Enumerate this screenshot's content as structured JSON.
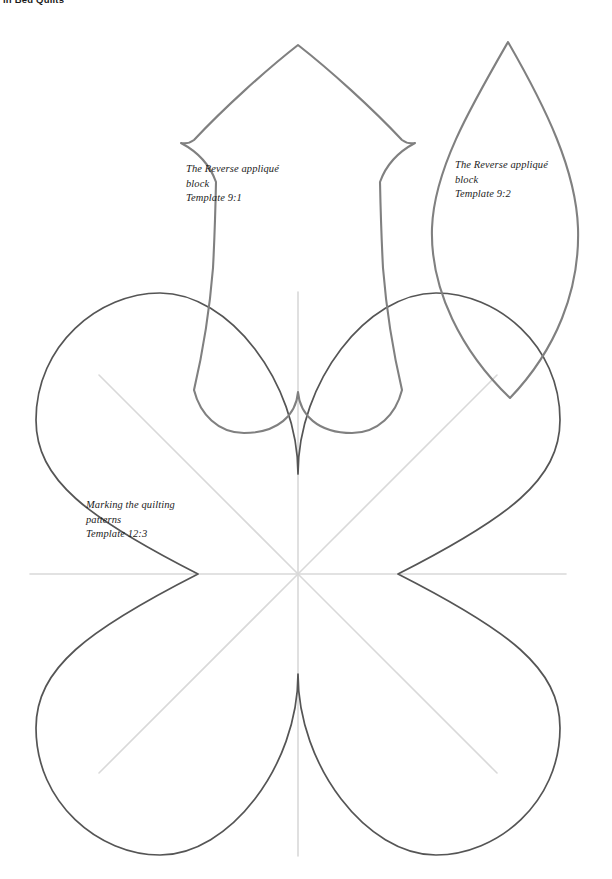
{
  "page": {
    "running_head": "in Bed Quilts",
    "background_color": "#ffffff",
    "width": 612,
    "height": 879
  },
  "colors": {
    "tulip_outline": "#808080",
    "leaf_outline": "#808080",
    "flower_outline": "#555555",
    "fold_line": "#d9d9d9",
    "label_text": "#1c1c1c",
    "running_head_text": "#1a1a1a"
  },
  "templates": [
    {
      "id": "tulip",
      "name": "reverse-applique-block-tulip",
      "shape": "tulip",
      "outline_color": "#808080",
      "label": {
        "line1": "The Reverse appliqué",
        "line2": "block",
        "line3": "Template 9:1",
        "text": "The Reverse appliqué\nblock\nTemplate 9:1"
      }
    },
    {
      "id": "leaf",
      "name": "reverse-applique-block-leaf",
      "shape": "pointed-oval-leaf",
      "outline_color": "#808080",
      "label": {
        "line1": "The Reverse appliqué",
        "line2": "block",
        "line3": "Template 9:2",
        "text": "The Reverse appliqué\nblock\nTemplate 9:2"
      }
    },
    {
      "id": "flower",
      "name": "marking-the-quilting-patterns-flower",
      "shape": "eight-petal-flower",
      "petal_count": 8,
      "fold_line_count": 8,
      "outline_color": "#555555",
      "label": {
        "line1": "Marking the quilting",
        "line2": "patterns",
        "line3": "Template 12:3",
        "text": "Marking the quilting\npatterns\nTemplate 12:3"
      }
    }
  ]
}
